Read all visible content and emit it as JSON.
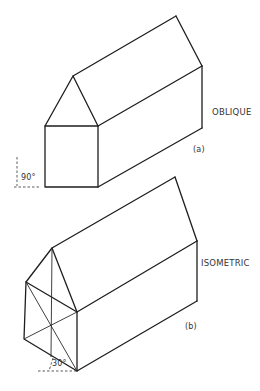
{
  "figure": {
    "a": {
      "view_label": "OBLIQUE",
      "caption": "(a)",
      "angle_label": "90°"
    },
    "b": {
      "view_label": "ISOMETRIC",
      "caption": "(b)",
      "angle_label": "30°"
    }
  },
  "colors": {
    "line": "#1e1e1e",
    "text": "#333333",
    "background": "#ffffff"
  }
}
